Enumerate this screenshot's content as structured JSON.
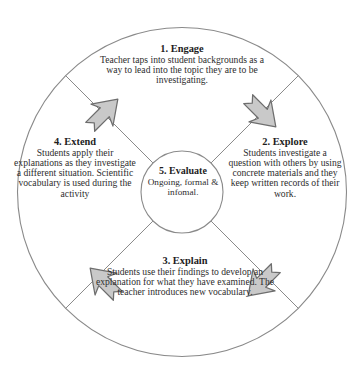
{
  "diagram": {
    "type": "cycle",
    "colors": {
      "stroke": "#8a8a8a",
      "text": "#2d2d2d",
      "heading": "#1d1d1d",
      "arrow_fill": "#c9c9c9",
      "arrow_stroke": "#6e6e6e",
      "background": "#ffffff"
    },
    "segments": [
      {
        "id": "engage",
        "heading": "1. Engage",
        "body": "Teacher taps into student backgrounds as a way to lead into the topic they are to be investigating.",
        "position": "top"
      },
      {
        "id": "explore",
        "heading": "2. Explore",
        "body": "Students investigate a question with others by using concrete materials and they keep written records of their work.",
        "position": "right"
      },
      {
        "id": "explain",
        "heading": "3. Explain",
        "body": "Students use their findings to develop an explanation for what they have examined. The teacher introduces new vocabulary.",
        "position": "bottom"
      },
      {
        "id": "extend",
        "heading": "4. Extend",
        "body": "Students apply their explanations as they investigate a different situation. Scientific vocabulary is used during the activity",
        "position": "left"
      },
      {
        "id": "evaluate",
        "heading": "5. Evaluate",
        "body": "Ongoing, formal & infomal.",
        "position": "center"
      }
    ],
    "arrows": [
      {
        "id": "extend-to-engage",
        "from": "4. Extend",
        "to": "1. Engage",
        "direction": "up-right"
      },
      {
        "id": "engage-to-explore",
        "from": "1. Engage",
        "to": "2. Explore",
        "direction": "down-right"
      },
      {
        "id": "explore-to-explain",
        "from": "2. Explore",
        "to": "3. Explain",
        "direction": "down-left"
      },
      {
        "id": "explain-to-extend",
        "from": "3. Explain",
        "to": "4. Extend",
        "direction": "up-left"
      }
    ]
  }
}
